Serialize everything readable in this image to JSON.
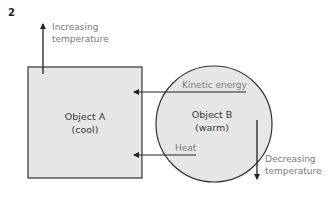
{
  "figure_number": "2",
  "object_a": {
    "name": "Object A",
    "state": "(cool)"
  },
  "object_b": {
    "name": "Object B",
    "state": "(warm)"
  },
  "arrows": {
    "kinetic_energy": "Kinetic energy",
    "heat": "Heat",
    "increasing_line1": "Increasing",
    "increasing_line2": "temperature",
    "decreasing_line1": "Decreasing",
    "decreasing_line2": "temperature"
  },
  "colors": {
    "fill": "#e6e6e6",
    "stroke": "#333333",
    "label": "#7a7a7a"
  }
}
